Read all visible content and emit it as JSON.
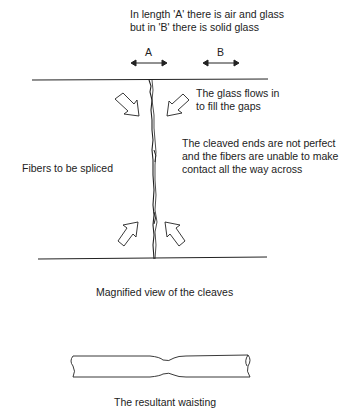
{
  "diagram": {
    "top_note": {
      "line1": "In length 'A' there is air and glass",
      "line2": "but in 'B' there is solid glass"
    },
    "markers": {
      "a": "A",
      "b": "B"
    },
    "flow_note": {
      "line1": "The glass flows in",
      "line2": "to fill the gaps"
    },
    "cleave_note": {
      "line1": "The cleaved ends are not perfect",
      "line2": "and the fibers are unable to make",
      "line3": "contact all the way across"
    },
    "fibers_label": "Fibers to be spliced",
    "magnified_caption": "Magnified view of the cleaves",
    "waisting_caption": "The resultant waisting",
    "colors": {
      "ink": "#222222",
      "background": "#ffffff"
    }
  }
}
